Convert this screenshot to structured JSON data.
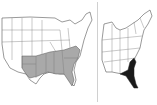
{
  "figure": {
    "panels": [
      {
        "id": "left",
        "description": "Map of the contiguous United States with southeastern states shaded gray",
        "shaded_color": "#a9a9a9",
        "outline_color": "#555555"
      },
      {
        "id": "right",
        "description": "Map of the eastern United States with Florida and coastal Georgia/South Carolina shaded black",
        "shaded_color": "#1a1a1a",
        "outline_color": "#555555"
      }
    ],
    "divider_color": "#d0d0d0"
  }
}
